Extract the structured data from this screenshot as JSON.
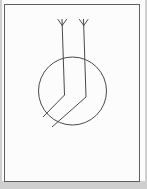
{
  "colors": {
    "backdrop": "#cfcfcf",
    "page": "#fcfcfc",
    "frame_border": "#5f5f5f",
    "stroke": "#4a4a4a"
  },
  "figure": {
    "stroke_width": 1,
    "circle": {
      "cx": 72.5,
      "cy": 91,
      "r": 34
    },
    "arrows": [
      {
        "name": "left-arrow",
        "path": [
          [
            62,
            19
          ],
          [
            64.5,
            95
          ],
          [
            43,
            117
          ]
        ],
        "fletching": [
          [
            [
              62.2,
              25.5
            ],
            [
              58,
              19.5
            ]
          ],
          [
            [
              62.2,
              25.5
            ],
            [
              66.5,
              19.5
            ]
          ]
        ]
      },
      {
        "name": "right-arrow",
        "path": [
          [
            83.5,
            19
          ],
          [
            86,
            97
          ],
          [
            52,
            127
          ]
        ],
        "fletching": [
          [
            [
              83.7,
              25.5
            ],
            [
              79.5,
              19.5
            ]
          ],
          [
            [
              83.7,
              25.5
            ],
            [
              88,
              19.5
            ]
          ]
        ]
      }
    ]
  }
}
